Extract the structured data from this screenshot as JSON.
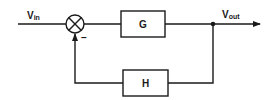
{
  "diagram": {
    "type": "block-diagram",
    "input_label": {
      "main": "V",
      "sub": "in"
    },
    "output_label": {
      "main": "V",
      "sub": "out"
    },
    "summing_junction": {
      "feedback_sign": "–"
    },
    "blocks": [
      {
        "id": "forward",
        "label": "G"
      },
      {
        "id": "feedback",
        "label": "H"
      }
    ],
    "connections": [
      {
        "from": "Vin",
        "to": "summing_junction"
      },
      {
        "from": "summing_junction",
        "to": "G"
      },
      {
        "from": "G",
        "to": "Vout"
      },
      {
        "from": "Vout",
        "to": "H"
      },
      {
        "from": "H",
        "to": "summing_junction",
        "sign": "-"
      }
    ],
    "colors": {
      "line": "#1a1a1a",
      "background": "#ffffff"
    }
  }
}
